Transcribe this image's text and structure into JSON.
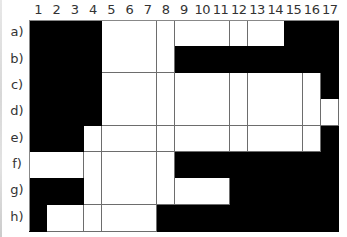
{
  "puzzle": {
    "columns": [
      "1",
      "2",
      "3",
      "4",
      "5",
      "6",
      "7",
      "8",
      "9",
      "10",
      "11",
      "12",
      "13",
      "14",
      "15",
      "16",
      "17"
    ],
    "rows": [
      {
        "label": "a)",
        "cells": "BBBBWWWWWWWWWWBBB"
      },
      {
        "label": "b)",
        "cells": "BBBBWWWWBBBBBBBBB"
      },
      {
        "label": "c)",
        "cells": "BBBBWWWWWWWWWWWWB"
      },
      {
        "label": "d)",
        "cells": "BBBBWWWWWWWWWWWWW"
      },
      {
        "label": "e)",
        "cells": "BBBWWWWWWWWWWWWWB"
      },
      {
        "label": "f)",
        "cells": "WWWWWWWWBBBBBBBBB"
      },
      {
        "label": "g)",
        "cells": "BBBWWWWWWWWBBBBBB"
      },
      {
        "label": "h)",
        "cells": "BWWWWWWBBBBBBBBBB"
      }
    ],
    "legend": {
      "B": "filled (black)",
      "W": "empty (white)"
    },
    "colors": {
      "filled": "#000000",
      "empty": "#ffffff",
      "gridline": "#6d6d6d"
    }
  }
}
